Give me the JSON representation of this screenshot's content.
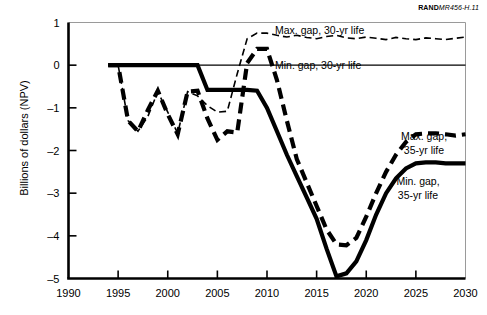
{
  "figure": {
    "source_id_bold": "RAND",
    "source_id_italic": "MR456-H.11",
    "ylabel": "Billions of dollars (NPV)"
  },
  "annotations": {
    "max30": "Max. gap, 30-yr life",
    "min30": "Min. gap, 30-yr life",
    "max35_l1": "Max. gap,",
    "max35_l2": "35-yr life",
    "min35_l1": "Min. gap,",
    "min35_l2": "35-yr life"
  },
  "chart_data": {
    "type": "line",
    "title": "",
    "xlabel": "",
    "ylabel": "Billions of dollars (NPV)",
    "xlim": [
      1990,
      2030
    ],
    "ylim": [
      -5,
      1
    ],
    "xticks": [
      1990,
      1995,
      2000,
      2005,
      2010,
      2015,
      2020,
      2025,
      2030
    ],
    "yticks": [
      1,
      0,
      -1,
      -2,
      -3,
      -4,
      -5
    ],
    "grid": false,
    "legend": "inline-annotations",
    "series": [
      {
        "name": "Max. gap, 30-yr life",
        "style": "thin-dashed",
        "x": [
          1994,
          1995,
          1996,
          1997,
          1998,
          1999,
          2000,
          2001,
          2002,
          2003,
          2004,
          2005,
          2006,
          2007,
          2008,
          2009,
          2010,
          2011,
          2012,
          2013,
          2014,
          2015,
          2016,
          2017,
          2018,
          2019,
          2020,
          2021,
          2022,
          2023,
          2024,
          2025,
          2026,
          2027,
          2028,
          2029,
          2030
        ],
        "y": [
          0.0,
          0.0,
          -1.3,
          -1.55,
          -1.2,
          -0.62,
          -1.1,
          -1.6,
          -0.62,
          -0.72,
          -0.95,
          -1.1,
          -1.08,
          -0.2,
          0.62,
          0.75,
          0.75,
          0.7,
          0.66,
          0.7,
          0.65,
          0.62,
          0.67,
          0.7,
          0.64,
          0.62,
          0.66,
          0.63,
          0.6,
          0.65,
          0.62,
          0.6,
          0.64,
          0.62,
          0.6,
          0.63,
          0.66
        ]
      },
      {
        "name": "Min. gap, 30-yr life",
        "style": "thin-solid",
        "x": [
          1994,
          2030
        ],
        "y": [
          0.0,
          0.0
        ]
      },
      {
        "name": "Max. gap, 35-yr life",
        "style": "thick-dashed",
        "x": [
          1994,
          1995,
          1996,
          1997,
          1998,
          1999,
          2000,
          2001,
          2002,
          2003,
          2004,
          2005,
          2006,
          2007,
          2008,
          2009,
          2010,
          2011,
          2012,
          2013,
          2014,
          2015,
          2016,
          2017,
          2018,
          2019,
          2020,
          2021,
          2022,
          2023,
          2024,
          2025,
          2026,
          2027,
          2028,
          2029,
          2030
        ],
        "y": [
          0.0,
          0.0,
          -1.3,
          -1.55,
          -1.05,
          -0.6,
          -1.15,
          -1.62,
          -0.62,
          -0.6,
          -1.25,
          -1.75,
          -1.55,
          -1.58,
          0.05,
          0.38,
          0.38,
          -0.35,
          -1.3,
          -2.2,
          -2.75,
          -3.3,
          -3.85,
          -4.2,
          -4.22,
          -4.05,
          -3.55,
          -3.0,
          -2.5,
          -2.1,
          -1.8,
          -1.62,
          -1.6,
          -1.6,
          -1.62,
          -1.65,
          -1.62
        ]
      },
      {
        "name": "Min. gap, 35-yr life",
        "style": "thick-solid",
        "x": [
          1994,
          1995,
          1996,
          1997,
          1998,
          1999,
          2000,
          2001,
          2002,
          2003,
          2004,
          2005,
          2006,
          2007,
          2008,
          2009,
          2010,
          2011,
          2012,
          2013,
          2014,
          2015,
          2016,
          2017,
          2018,
          2019,
          2020,
          2021,
          2022,
          2023,
          2024,
          2025,
          2026,
          2027,
          2028,
          2029,
          2030
        ],
        "y": [
          0.0,
          0.0,
          0.0,
          0.0,
          0.0,
          0.0,
          0.0,
          0.0,
          0.0,
          0.0,
          -0.58,
          -0.58,
          -0.58,
          -0.58,
          -0.58,
          -0.6,
          -1.0,
          -1.55,
          -2.1,
          -2.6,
          -3.1,
          -3.6,
          -4.3,
          -4.95,
          -4.88,
          -4.6,
          -4.1,
          -3.5,
          -3.0,
          -2.65,
          -2.42,
          -2.3,
          -2.28,
          -2.28,
          -2.3,
          -2.3,
          -2.3
        ]
      }
    ]
  }
}
